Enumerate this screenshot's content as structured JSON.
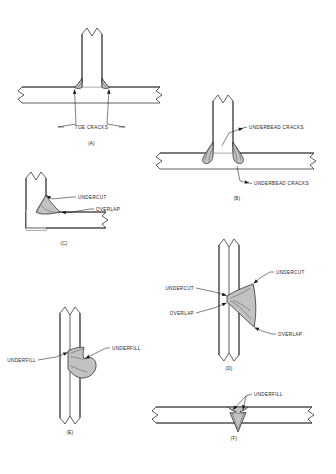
{
  "figure": {
    "background_color": "#ffffff",
    "line_color": "#1a1a1a",
    "bead_fill_color": "#c2c2c2",
    "crack_color": "#4a4a4a"
  },
  "panels": [
    {
      "id": "A",
      "letter": "(A)",
      "joint_type": "tee-joint",
      "defect": "toe cracks",
      "labels": [
        {
          "text": "TOE CRACKS",
          "anchor": "middle"
        }
      ]
    },
    {
      "id": "B",
      "letter": "(B)",
      "joint_type": "tee-joint",
      "defect": "underbead cracks",
      "labels": [
        {
          "text": "UNDERBEAD CRACKS",
          "anchor": "start"
        },
        {
          "text": "UNDERBEAD CRACKS",
          "anchor": "start"
        }
      ]
    },
    {
      "id": "C",
      "letter": "(C)",
      "joint_type": "corner-joint",
      "defect": "undercut and overlap",
      "labels": [
        {
          "text": "UNDERCUT",
          "anchor": "start"
        },
        {
          "text": "OVERLAP",
          "anchor": "start"
        }
      ]
    },
    {
      "id": "D",
      "letter": "(D)",
      "joint_type": "butt-joint-vertical",
      "defect": "undercut and overlap",
      "labels": [
        {
          "text": "UNDERCUT",
          "anchor": "end"
        },
        {
          "text": "OVERLAP",
          "anchor": "end"
        },
        {
          "text": "UNDERCUT",
          "anchor": "start"
        },
        {
          "text": "OVERLAP",
          "anchor": "start"
        }
      ]
    },
    {
      "id": "E",
      "letter": "(E)",
      "joint_type": "butt-joint-vertical",
      "defect": "underfill",
      "labels": [
        {
          "text": "UNDERFILL",
          "anchor": "end"
        },
        {
          "text": "UNDERFILL",
          "anchor": "start"
        }
      ]
    },
    {
      "id": "F",
      "letter": "(F)",
      "joint_type": "butt-joint-horizontal",
      "defect": "underfill",
      "labels": [
        {
          "text": "UNDERFILL",
          "anchor": "start"
        }
      ]
    }
  ],
  "text": {
    "toe_cracks": "TOE CRACKS",
    "underbead_cracks_b_top": "UNDERBEAD CRACKS",
    "underbead_cracks_b_bottom": "UNDERBEAD CRACKS",
    "undercut_c": "UNDERCUT",
    "overlap_c": "OVERLAP",
    "undercut_d_left": "UNDERCUT",
    "overlap_d_left": "OVERLAP",
    "undercut_d_right": "UNDERCUT",
    "overlap_d_right": "OVERLAP",
    "underfill_e_left": "UNDERFILL",
    "underfill_e_right": "UNDERFILL",
    "underfill_f": "UNDERFILL",
    "letter_a": "(A)",
    "letter_b": "(B)",
    "letter_c": "(C)",
    "letter_d": "(D)",
    "letter_e": "(E)",
    "letter_f": "(F)"
  }
}
